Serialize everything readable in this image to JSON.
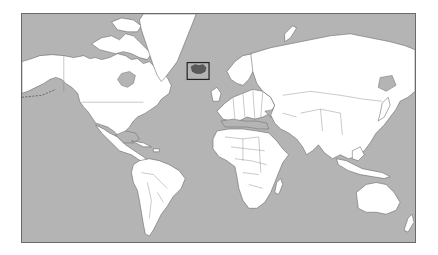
{
  "map": {
    "type": "world-locator-map",
    "projection": "mercator",
    "highlighted_country": "Iceland",
    "colors": {
      "ocean": "#b4b4b4",
      "land": "#ffffff",
      "highlight": "#5a5a5a",
      "borders": "#555555",
      "locator_box": "#222222",
      "frame": "#6a6a6a"
    },
    "locator_box": {
      "x": 187,
      "y": 62,
      "width": 22,
      "height": 17
    },
    "frame": {
      "x": 21,
      "y": 13,
      "width": 395,
      "height": 230
    }
  }
}
